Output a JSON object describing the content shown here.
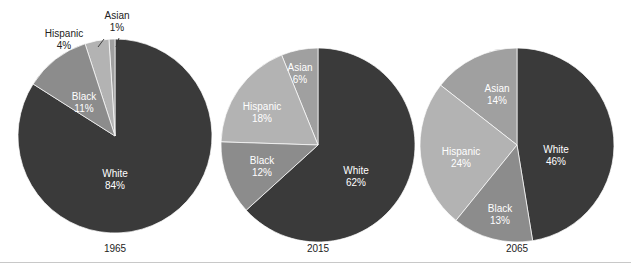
{
  "chart_data": {
    "type": "pie",
    "title": "",
    "subtitle": "",
    "xlabel": "",
    "ylabel": "",
    "legend_position": "none",
    "grid": false,
    "value_suffix": "%",
    "categories": [
      "White",
      "Black",
      "Hispanic",
      "Asian"
    ],
    "colors": {
      "White": "#3a3a3a",
      "Black": "#8c8c8c",
      "Hispanic": "#b3b3b3",
      "Asian": "#a0a0a0"
    },
    "charts": [
      {
        "year": "1965",
        "center": [
          115,
          136
        ],
        "radius": 97,
        "slices": [
          {
            "name": "White",
            "value": 84,
            "label_name": "White",
            "label_value": "84%",
            "label_placement": "inside",
            "label_x": 115,
            "label_y": 168,
            "color_key": "White"
          },
          {
            "name": "Black",
            "value": 11,
            "label_name": "Black",
            "label_value": "11%",
            "label_placement": "inside",
            "label_x": 84,
            "label_y": 91,
            "color_key": "Black"
          },
          {
            "name": "Hispanic",
            "value": 4,
            "label_name": "Hispanic",
            "label_value": "4%",
            "label_placement": "outside",
            "label_x": 64,
            "label_y": 28,
            "leader": [
              98,
              47,
              104,
              39
            ],
            "color_key": "Hispanic"
          },
          {
            "name": "Asian",
            "value": 1,
            "label_name": "Asian",
            "label_value": "1%",
            "label_placement": "outside",
            "label_x": 117,
            "label_y": 10,
            "leader": [
              116,
              47,
              119,
              38
            ],
            "color_key": "Asian"
          }
        ]
      },
      {
        "year": "2015",
        "center": [
          318,
          145
        ],
        "radius": 97,
        "slices": [
          {
            "name": "White",
            "value": 62,
            "label_name": "White",
            "label_value": "62%",
            "label_placement": "inside",
            "label_x": 356,
            "label_y": 165,
            "color_key": "White"
          },
          {
            "name": "Black",
            "value": 12,
            "label_name": "Black",
            "label_value": "12%",
            "label_placement": "inside",
            "label_x": 262,
            "label_y": 155,
            "color_key": "Black"
          },
          {
            "name": "Hispanic",
            "value": 18,
            "label_name": "Hispanic",
            "label_value": "18%",
            "label_placement": "inside",
            "label_x": 262,
            "label_y": 101,
            "color_key": "Hispanic"
          },
          {
            "name": "Asian",
            "value": 6,
            "label_name": "Asian",
            "label_value": "6%",
            "label_placement": "inside",
            "label_x": 300,
            "label_y": 62,
            "color_key": "Asian"
          }
        ]
      },
      {
        "year": "2065",
        "center": [
          517,
          145
        ],
        "radius": 97,
        "slices": [
          {
            "name": "White",
            "value": 46,
            "label_name": "White",
            "label_value": "46%",
            "label_placement": "inside",
            "label_x": 556,
            "label_y": 144,
            "color_key": "White"
          },
          {
            "name": "Black",
            "value": 13,
            "label_name": "Black",
            "label_value": "13%",
            "label_placement": "inside",
            "label_x": 500,
            "label_y": 203,
            "color_key": "Black"
          },
          {
            "name": "Hispanic",
            "value": 24,
            "label_name": "Hispanic",
            "label_value": "24%",
            "label_placement": "inside",
            "label_x": 461,
            "label_y": 146,
            "color_key": "Hispanic"
          },
          {
            "name": "Asian",
            "value": 14,
            "label_name": "Asian",
            "label_value": "14%",
            "label_placement": "inside",
            "label_x": 497,
            "label_y": 83,
            "color_key": "Asian"
          }
        ]
      }
    ],
    "year_labels": [
      {
        "text": "1965",
        "x": 115,
        "y": 243
      },
      {
        "text": "2015",
        "x": 318,
        "y": 243
      },
      {
        "text": "2065",
        "x": 517,
        "y": 243
      }
    ],
    "rule_y": 262
  }
}
